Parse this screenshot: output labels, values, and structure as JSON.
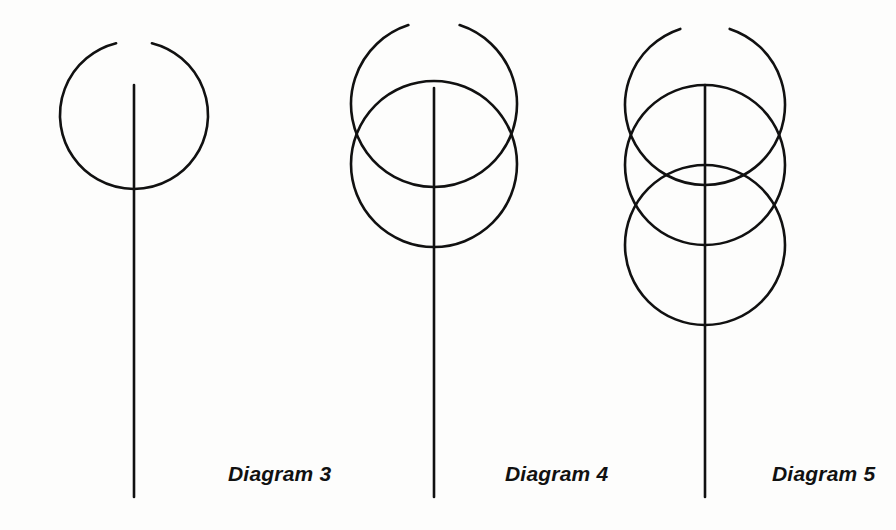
{
  "page": {
    "background_color": "#fdfdfc",
    "ink_color": "#111111",
    "width": 896,
    "height": 530
  },
  "captions": {
    "diagram3": "Diagram 3",
    "diagram4": "Diagram 4",
    "diagram5": "Diagram 5"
  },
  "figure": {
    "stroke_color": "#111111",
    "stroke_width": 2.6,
    "diagrams": [
      {
        "name": "diagram-3",
        "label": "Diagram 3",
        "axis": {
          "x": 134,
          "y_top": 85,
          "y_bottom": 497
        },
        "circles": [],
        "arcs": [
          {
            "name": "upper-open-arc",
            "cx": 134,
            "cy": 115,
            "r": 74,
            "start_angle_deg": -76,
            "end_angle_deg": 256,
            "open_toward": "up"
          }
        ]
      },
      {
        "name": "diagram-4",
        "label": "Diagram 4",
        "axis": {
          "x": 434,
          "y_top": 88,
          "y_bottom": 497
        },
        "circles": [
          {
            "name": "lower-circle",
            "cx": 434,
            "cy": 164,
            "r": 83
          }
        ],
        "arcs": [
          {
            "name": "upper-open-arc",
            "cx": 434,
            "cy": 104,
            "r": 83,
            "start_angle_deg": -72,
            "end_angle_deg": 252,
            "open_toward": "up"
          }
        ]
      },
      {
        "name": "diagram-5",
        "label": "Diagram 5",
        "axis": {
          "x": 705,
          "y_top": 85,
          "y_bottom": 497
        },
        "circles": [
          {
            "name": "middle-circle",
            "cx": 705,
            "cy": 165,
            "r": 80
          },
          {
            "name": "lower-circle",
            "cx": 705,
            "cy": 245,
            "r": 80
          }
        ],
        "arcs": [
          {
            "name": "upper-open-arc",
            "cx": 705,
            "cy": 105,
            "r": 80,
            "start_angle_deg": -72,
            "end_angle_deg": 252,
            "open_toward": "up"
          }
        ]
      }
    ]
  }
}
